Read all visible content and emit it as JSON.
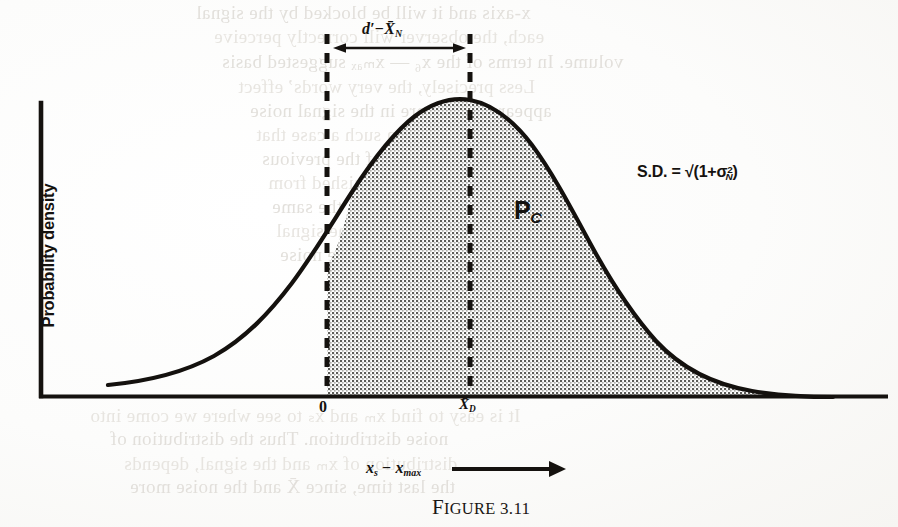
{
  "figure": {
    "caption_small_caps": "FIGURE",
    "caption_number": "3.11",
    "axes": {
      "y_label": "Probability density",
      "x_label_main": "x",
      "x_label_sub1": "s",
      "x_label_minus": " − x",
      "x_label_sub2": "max",
      "x_axis_has_arrow": true,
      "x_ticks": [
        {
          "name": "origin",
          "label": "0",
          "x_px": 327
        },
        {
          "name": "mean-d",
          "label": "X̄",
          "sub": "D",
          "x_px": 470
        }
      ]
    },
    "annotations": {
      "span_label_lead": "d′−X̄",
      "span_label_sub": "N",
      "sd_label_prefix": "S.D. = √(1+σ",
      "sd_label_sup": "2",
      "sd_label_sub": "N",
      "sd_label_suffix": ")",
      "region_label": "P",
      "region_label_sub": "C"
    },
    "colors": {
      "ink": "#15120f",
      "curve": "#14110e",
      "shading": "#9a9a96",
      "paper": "#fbfbfa",
      "ghost_text": "#dedbd6"
    }
  },
  "chart_data": {
    "type": "area",
    "title": "FIGURE 3.11",
    "xlabel": "x_s − x_max",
    "ylabel": "Probability density",
    "grid": false,
    "legend": "none",
    "xlim": [
      -3.1,
      4.4
    ],
    "ylim": [
      0,
      1.06
    ],
    "x_tick_values": [
      0,
      1
    ],
    "x_tick_labels": [
      "0",
      "X̄_D"
    ],
    "peak_x": 1.0,
    "peak_y": 1.0,
    "shaded_region": {
      "from": 0,
      "to": 4.0,
      "label": "P_C"
    },
    "span_arrow": {
      "from": 0,
      "to": 1.0,
      "label": "d' − X̄_N"
    },
    "x": [
      -3.1,
      -2.8,
      -2.5,
      -2.2,
      -1.9,
      -1.6,
      -1.3,
      -1.0,
      -0.7,
      -0.4,
      -0.1,
      0.0,
      0.2,
      0.5,
      0.8,
      1.0,
      1.2,
      1.5,
      1.8,
      2.1,
      2.4,
      2.7,
      3.0,
      3.3,
      3.6,
      3.9,
      4.2
    ],
    "y": [
      0.03,
      0.05,
      0.07,
      0.1,
      0.14,
      0.19,
      0.26,
      0.35,
      0.46,
      0.58,
      0.7,
      0.73,
      0.8,
      0.9,
      0.98,
      1.0,
      0.99,
      0.93,
      0.82,
      0.68,
      0.54,
      0.4,
      0.28,
      0.19,
      0.12,
      0.07,
      0.04
    ],
    "series": [
      {
        "name": "probability density",
        "values": [
          0.03,
          0.05,
          0.07,
          0.1,
          0.14,
          0.19,
          0.26,
          0.35,
          0.46,
          0.58,
          0.7,
          0.73,
          0.8,
          0.9,
          0.98,
          1.0,
          0.99,
          0.93,
          0.82,
          0.68,
          0.54,
          0.4,
          0.28,
          0.19,
          0.12,
          0.07,
          0.04
        ]
      }
    ]
  },
  "bleed_through_lines": [
    {
      "text": "x-axis and it will be blocked by the signal",
      "x": 196,
      "y": 2
    },
    {
      "text": "each, the observer will correctly perceive",
      "x": 214,
      "y": 26
    },
    {
      "text": "volume. In terms of the x₆ — xₘₐₓ suggested basis",
      "x": 222,
      "y": 50
    },
    {
      "text": "Less precisely, the very words’ effect",
      "x": 238,
      "y": 76
    },
    {
      "text": "appears to be more in the signal noise",
      "x": 250,
      "y": 100
    },
    {
      "text": "One can see in such a case that",
      "x": 256,
      "y": 124
    },
    {
      "text": "and in each of the previous",
      "x": 262,
      "y": 148
    },
    {
      "text": "may be distinguished from",
      "x": 268,
      "y": 172
    },
    {
      "text": "approximately in the same",
      "x": 272,
      "y": 196
    },
    {
      "text": "on more of the signal",
      "x": 276,
      "y": 220
    },
    {
      "text": "possible by the noise",
      "x": 280,
      "y": 244
    },
    {
      "text": "It is easy to find xₘ and xₛ to see where we come into",
      "x": 90,
      "y": 404
    },
    {
      "text": "noise distribution. Thus the distribution of",
      "x": 110,
      "y": 428
    },
    {
      "text": "distribution of xₘ and the signal, depends",
      "x": 124,
      "y": 452
    },
    {
      "text": "the last time, since X̄ and the noise more",
      "x": 130,
      "y": 476
    }
  ]
}
